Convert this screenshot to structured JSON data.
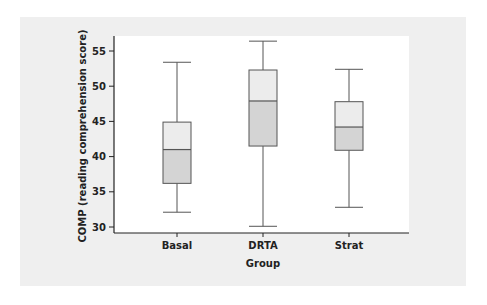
{
  "chart_data": {
    "type": "box",
    "title": "",
    "xlabel": "Group",
    "ylabel": "COMP (reading comprehension score)",
    "ylim": [
      29.2,
      57.8
    ],
    "yticks": [
      30,
      35,
      40,
      45,
      50,
      55
    ],
    "grid": false,
    "legend": null,
    "categories": [
      "Basal",
      "DRTA",
      "Strat"
    ],
    "series": [
      {
        "name": "Basal",
        "min": 32.1,
        "q1": 36.2,
        "median": 41.0,
        "q3": 44.9,
        "max": 53.4
      },
      {
        "name": "DRTA",
        "min": 30.1,
        "q1": 41.5,
        "median": 47.9,
        "q3": 52.3,
        "max": 56.4
      },
      {
        "name": "Strat",
        "min": 32.8,
        "q1": 40.9,
        "median": 44.2,
        "q3": 47.8,
        "max": 52.4
      }
    ],
    "colors": {
      "upper_box": "#ececec",
      "lower_box": "#d4d4d4",
      "outline": "#555555",
      "background": "#efefef",
      "plot_area": "#ffffff"
    }
  }
}
